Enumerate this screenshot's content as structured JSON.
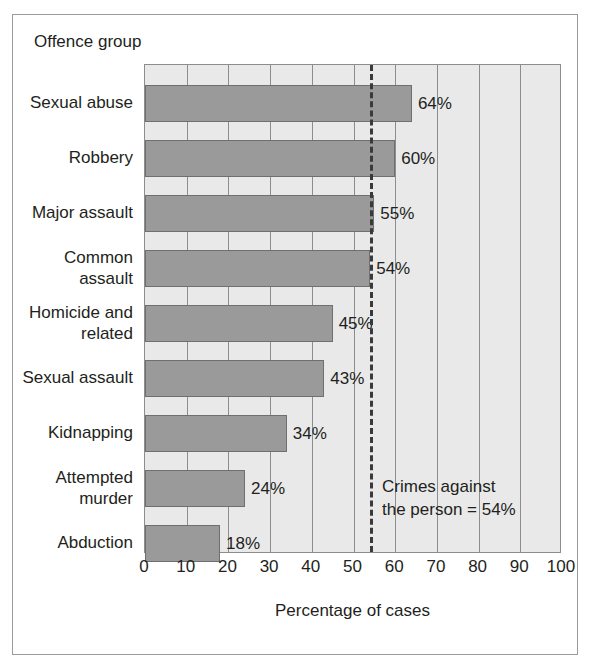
{
  "chart_data": {
    "type": "bar",
    "orientation": "horizontal",
    "title": "",
    "xlabel": "Percentage of cases",
    "ylabel": "Offence group",
    "xlim": [
      0,
      100
    ],
    "xticks": [
      0,
      10,
      20,
      30,
      40,
      50,
      60,
      70,
      80,
      90,
      100
    ],
    "xtick_labels": [
      "0",
      "10",
      "20",
      "30",
      "40",
      "50",
      "60",
      "70",
      "80",
      "90",
      "100"
    ],
    "grid": true,
    "legend": "none",
    "categories": [
      "Sexual abuse",
      "Robbery",
      "Major assault",
      "Common\nassault",
      "Homicide and\nrelated",
      "Sexual assault",
      "Kidnapping",
      "Attempted\nmurder",
      "Abduction"
    ],
    "values": [
      64,
      60,
      55,
      54,
      45,
      43,
      34,
      24,
      18
    ],
    "value_labels": [
      "64%",
      "60%",
      "55%",
      "54%",
      "45%",
      "43%",
      "34%",
      "24%",
      "18%"
    ],
    "reference_line": {
      "value": 54,
      "style": "dashed",
      "label": "Crimes against\nthe person = 54%"
    },
    "colors": {
      "bar_fill": "#9a9a9a",
      "bar_edge": "#6f6f6f",
      "plot_background": "#e9e9e9",
      "gridline": "#8d8d8d",
      "reference_line": "#3a3a3a",
      "text": "#231f20",
      "frame": "#9b9b9b"
    }
  },
  "annotation": {
    "text": "Crimes against\nthe person = 54%"
  }
}
